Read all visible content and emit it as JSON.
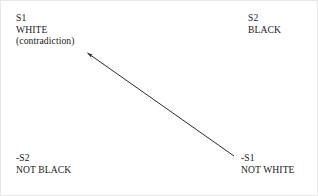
{
  "diagram": {
    "type": "logical-square-contradiction",
    "background_color": "#ffffff",
    "line_color": "#2a2a2a",
    "text_color": "#181818",
    "border_color": "#e8e8e8",
    "nodes": [
      {
        "id": "s1",
        "position": "top-left",
        "symbol": "S1",
        "value": "WHITE",
        "note": "(contradiction)"
      },
      {
        "id": "s2",
        "position": "top-right",
        "symbol": "S2",
        "value": "BLACK",
        "note": ""
      },
      {
        "id": "not-s2",
        "position": "bottom-left",
        "symbol": "-S2",
        "value": "NOT BLACK",
        "note": ""
      },
      {
        "id": "not-s1",
        "position": "bottom-right",
        "symbol": "-S1",
        "value": "NOT WHITE",
        "note": ""
      }
    ],
    "arrows": [
      {
        "id": "not-s1-to-s1",
        "from_node": "not-s1",
        "to_node": "s1",
        "from_x": 233,
        "from_y": 155,
        "to_x": 85,
        "to_y": 51,
        "style": "solid",
        "head": "filled-triangle-at-target"
      }
    ]
  }
}
